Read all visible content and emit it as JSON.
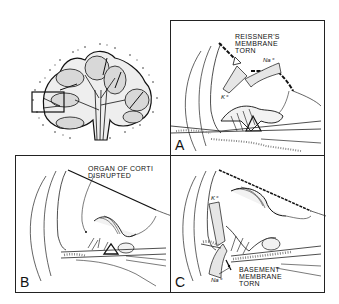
{
  "figure": {
    "overview": {
      "description": "Cross-section of cochlea with boxed region indicating area detailed in panels"
    },
    "panels": [
      {
        "letter": "A",
        "label_lines": [
          "REISSNER'S",
          "MEMBRANE",
          "TORN"
        ],
        "ions": [
          "K⁺",
          "Na⁺"
        ]
      },
      {
        "letter": "B",
        "label_lines": [
          "ORGAN OF CORTI",
          "DISRUPTED"
        ],
        "ions": []
      },
      {
        "letter": "C",
        "label_lines": [
          "BASEMENT",
          "MEMBRANE",
          "TORN"
        ],
        "ions": [
          "K⁺",
          "Na⁺"
        ]
      }
    ]
  },
  "colors": {
    "ink": "#111111",
    "stipple": "#9a9a9a",
    "fill_light": "#e6e6e6",
    "background": "#ffffff"
  }
}
